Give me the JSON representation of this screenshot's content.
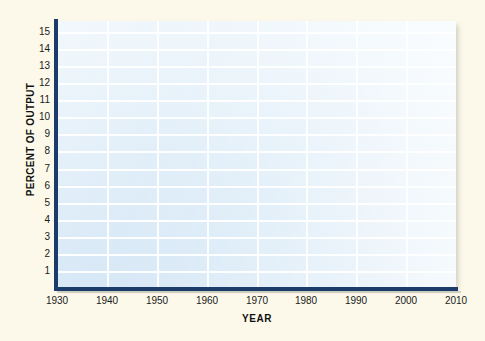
{
  "chart_data": {
    "type": "line",
    "title": "",
    "subtitle": "",
    "xlabel": "YEAR",
    "ylabel": "PERCENT OF OUTPUT",
    "x_tick_labels": [
      "1930",
      "1940",
      "1950",
      "1960",
      "1970",
      "1980",
      "1990",
      "2000",
      "2010"
    ],
    "y_tick_labels": [
      "15",
      "14",
      "13",
      "12",
      "11",
      "10",
      "9",
      "8",
      "7",
      "6",
      "5",
      "4",
      "3",
      "2",
      "1"
    ],
    "xlim": [
      1930,
      2010
    ],
    "ylim": [
      0,
      15.6
    ],
    "x_tick_step": 10,
    "y_tick_step": 1,
    "grid": true,
    "grid_color": "#ffffff",
    "legend": null,
    "series": [],
    "annotations": [],
    "plot_background": "#d9eaf7",
    "axis_color": "#1b3b6b",
    "page_background": "#fcf9ea",
    "note": "empty grid template, no data plotted"
  }
}
